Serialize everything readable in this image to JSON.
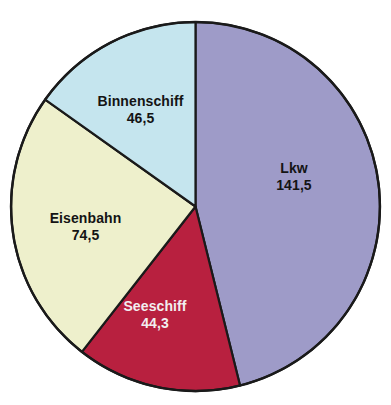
{
  "chart_data": {
    "type": "pie",
    "title": "",
    "subtitle": "",
    "xlabel": "",
    "ylabel": "",
    "legend_position": "none",
    "grid": false,
    "labels_on_slices": true,
    "decimal_separator": ",",
    "total": 306.8,
    "categories": [
      "Lkw",
      "Seeschiff",
      "Eisenbahn",
      "Binnenschiff"
    ],
    "values": [
      141.5,
      44.3,
      74.5,
      46.5
    ],
    "value_labels": [
      "141,5",
      "44,3",
      "74,5",
      "46,5"
    ],
    "start_angle_deg": 0,
    "direction": "clockwise",
    "slices": [
      {
        "name": "Lkw",
        "value": 141.5,
        "value_label": "141,5",
        "color": "#9e9bc8",
        "label_color": "#141414",
        "start_deg": 0,
        "end_deg": 166.0
      },
      {
        "name": "Seeschiff",
        "value": 44.3,
        "value_label": "44,3",
        "color": "#b8203f",
        "label_color": "#f2eef0",
        "start_deg": 166.0,
        "end_deg": 218.0
      },
      {
        "name": "Eisenbahn",
        "value": 74.5,
        "value_label": "74,5",
        "color": "#eef0cc",
        "label_color": "#141414",
        "start_deg": 218.0,
        "end_deg": 305.4
      },
      {
        "name": "Binnenschiff",
        "value": 46.5,
        "value_label": "46,5",
        "color": "#c5e5ee",
        "label_color": "#141414",
        "start_deg": 305.4,
        "end_deg": 360.0
      }
    ],
    "outline_color": "#1a1a1a",
    "background": "#ffffff"
  }
}
